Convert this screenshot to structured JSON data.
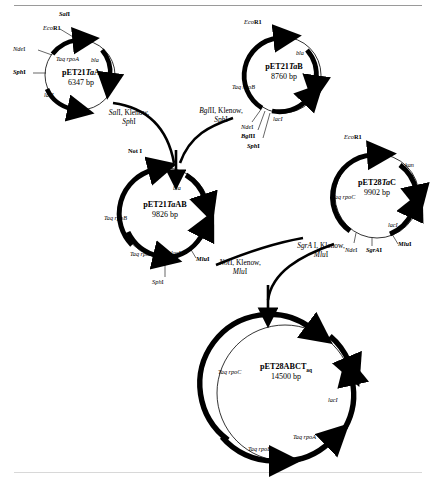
{
  "figure": {
    "background_color": "#ffffff",
    "stroke_color": "#000000",
    "rule_color": "#9a9a9a"
  },
  "plasmids": [
    {
      "id": "pET21TaA",
      "name_prefix": "pET21",
      "name_italic": "Ta",
      "name_suffix": "A",
      "size": "6347 bp",
      "genes": [
        "Taq rpoA",
        "bla",
        "lacI"
      ],
      "sites": [
        "SalI",
        "EcoR1",
        "NdeI",
        "SphI"
      ]
    },
    {
      "id": "pET21TaB",
      "name_prefix": "pET21",
      "name_italic": "Ta",
      "name_suffix": "B",
      "size": "8760 bp",
      "genes": [
        "Taq rpoB",
        "bla",
        "lacI"
      ],
      "sites": [
        "EcoR1",
        "NdeI",
        "BglII",
        "SphI"
      ]
    },
    {
      "id": "pET21TaAB",
      "name_prefix": "pET21",
      "name_italic": "Ta",
      "name_suffix": "AB",
      "size": "9826 bp",
      "genes": [
        "Taq rpoB",
        "Taq rpoA",
        "bla",
        "lacI"
      ],
      "sites": [
        "Not I",
        "MluI",
        "SphI"
      ]
    },
    {
      "id": "pET28TaC",
      "name_prefix": "pET28",
      "name_italic": "Ta",
      "name_suffix": "C",
      "size": "9902 bp",
      "genes": [
        "Taq rpoC",
        "kan",
        "lacI"
      ],
      "sites": [
        "EcoR1",
        "NdeI",
        "SgrAI",
        "MluI"
      ]
    },
    {
      "id": "pET28ABCTaq",
      "name_prefix": "pET28ABCT",
      "name_subscript": "aq",
      "size": "14500 bp",
      "genes": [
        "Taq rpoC",
        "Taq rpoB",
        "Taq rpoA",
        "kan",
        "lacI"
      ],
      "sites": []
    }
  ],
  "labels": {
    "pET21TaA": {
      "sal1": "Sal",
      "sal1_tail": "I",
      "ecor1": "Eco",
      "ecor1_tail": "R1",
      "ndei": "Nde",
      "ndei_tail": "I",
      "sphi": "Sph",
      "sphi_tail": "I",
      "rpoa": "Taq rpoA",
      "bla": "bla",
      "laci": "lacI",
      "name_prefix": "pET21",
      "name_italic": "Ta",
      "name_suffix": "A",
      "size": "6347 bp"
    },
    "pET21TaB": {
      "ecor1": "Eco",
      "ecor1_tail": "R1",
      "ndei": "Nde",
      "ndei_tail": "I",
      "bglii": "Bgl",
      "bglii_tail": "II",
      "sphi": "Sph",
      "sphi_tail": "I",
      "rpob": "Taq rpoB",
      "bla": "bla",
      "laci": "lacI",
      "name_prefix": "pET21",
      "name_italic": "Ta",
      "name_suffix": "B",
      "size": "8760 bp"
    },
    "pET21TaAB": {
      "noti": "Not I",
      "mlui": "Mlu",
      "mlui_tail": "I",
      "sphi": "Sph",
      "sphi_tail": "I",
      "rpob": "Taq rpoB",
      "rpoa": "Taq rpoA",
      "bla": "bla",
      "laci": "lacI",
      "name_prefix": "pET21",
      "name_italic": "Ta",
      "name_suffix": "AB",
      "size": "9826 bp"
    },
    "pET28TaC": {
      "ecor1": "Eco",
      "ecor1_tail": "R1",
      "ndei": "Nde",
      "ndei_tail": "I",
      "sgrai": "SgrA",
      "sgrai_tail": "I",
      "mlui": "Mlu",
      "mlui_tail": "I",
      "rpoc": "Taq rpoC",
      "kan": "kan",
      "laci": "lacI",
      "name_prefix": "pET28",
      "name_italic": "Ta",
      "name_suffix": "C",
      "size": "9902 bp"
    },
    "pET28ABCTaq": {
      "rpoc": "Taq rpoC",
      "rpob": "Taq rpoB",
      "rpoa": "Taq rpoA",
      "kan": "kan",
      "laci": "lacI",
      "name": "pET28ABCT",
      "name_sub": "aq",
      "size": "14500 bp"
    }
  },
  "steps": [
    {
      "id": "step-sal1-klenow-sphi",
      "line1_italic": "Sal",
      "line1_rest": "I, Klenow,",
      "line2_italic": "Sph",
      "line2_rest": "I"
    },
    {
      "id": "step-bglii-klenow-sphi",
      "line1_italic": "Bgl",
      "line1_rest": "II, Klenow,",
      "line2_italic": "Sph",
      "line2_rest": "I"
    },
    {
      "id": "step-noti-klenow-mlui",
      "line1_italic": "Not",
      "line1_rest": "I, Klenow,",
      "line2_italic": "Mlu",
      "line2_rest": "I"
    },
    {
      "id": "step-sgrai-klenow-mlui",
      "line1_italic": "SgrA",
      "line1_rest": " I, Klenow,",
      "line2_italic": "Mlu",
      "line2_rest": "I"
    }
  ]
}
